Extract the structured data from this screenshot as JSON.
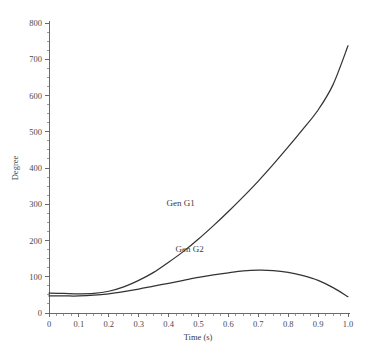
{
  "chart_data": {
    "type": "line",
    "title": "",
    "xlabel": "Time (s)",
    "ylabel": "Degree",
    "xlim": [
      0,
      1.0
    ],
    "ylim": [
      0,
      800
    ],
    "grid": false,
    "legend_position": "inline-annotations",
    "x_ticks": [
      "0",
      "0.1",
      "0.2",
      "0.3",
      "0.4",
      "0.5",
      "0.6",
      "0.7",
      "0.8",
      "0.9",
      "1.0"
    ],
    "x_tick_values": [
      0,
      0.1,
      0.2,
      0.3,
      0.4,
      0.5,
      0.6,
      0.7,
      0.8,
      0.9,
      1.0
    ],
    "y_ticks": [
      "0",
      "100",
      "200",
      "300",
      "400",
      "500",
      "600",
      "700",
      "800"
    ],
    "y_tick_values": [
      0,
      100,
      200,
      300,
      400,
      500,
      600,
      700,
      800
    ],
    "x": [
      0.0,
      0.05,
      0.1,
      0.15,
      0.2,
      0.25,
      0.3,
      0.35,
      0.4,
      0.45,
      0.5,
      0.55,
      0.6,
      0.65,
      0.7,
      0.75,
      0.8,
      0.85,
      0.9,
      0.95,
      1.0
    ],
    "series": [
      {
        "name": "Gen G1",
        "label": "Gen G1",
        "color": "#333333",
        "values": [
          55,
          54,
          53,
          54,
          60,
          72,
          90,
          112,
          140,
          170,
          204,
          241,
          280,
          321,
          364,
          410,
          458,
          508,
          560,
          630,
          737
        ]
      },
      {
        "name": "Gen G2",
        "label": "Gen G2",
        "color": "#333333",
        "values": [
          47,
          47,
          47,
          49,
          53,
          59,
          66,
          74,
          82,
          90,
          98,
          105,
          111,
          116,
          118,
          117,
          112,
          103,
          90,
          70,
          45
        ]
      }
    ],
    "annotations": [
      {
        "text": "Gen G1",
        "x": 0.44,
        "y": 295
      },
      {
        "text": "Gen G2",
        "x": 0.47,
        "y": 167
      }
    ]
  }
}
